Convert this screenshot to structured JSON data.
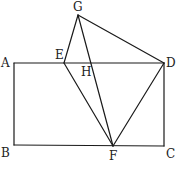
{
  "diagram": {
    "type": "geometry",
    "stroke_color": "#1a1a1a",
    "label_color": "#222222",
    "points": {
      "A": {
        "label": "A",
        "x": 14,
        "y": 63
      },
      "B": {
        "label": "B",
        "x": 14,
        "y": 145
      },
      "C": {
        "label": "C",
        "x": 164,
        "y": 146
      },
      "D": {
        "label": "D",
        "x": 164,
        "y": 63
      },
      "E": {
        "label": "E",
        "x": 64,
        "y": 63
      },
      "F": {
        "label": "F",
        "x": 113,
        "y": 146
      },
      "G": {
        "label": "G",
        "x": 78,
        "y": 15
      },
      "H": {
        "label": "H",
        "x": 91,
        "y": 63
      }
    },
    "segments": [
      [
        "A",
        "D"
      ],
      [
        "A",
        "B"
      ],
      [
        "B",
        "C"
      ],
      [
        "C",
        "D"
      ],
      [
        "G",
        "E"
      ],
      [
        "G",
        "D"
      ],
      [
        "G",
        "F"
      ],
      [
        "E",
        "F"
      ],
      [
        "D",
        "F"
      ]
    ]
  }
}
